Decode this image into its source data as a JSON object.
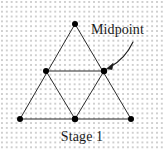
{
  "figure": {
    "caption": "Stage 1",
    "annotation_label": "Midpoint",
    "background": {
      "color": "#ffffff",
      "dot_color": "#cfcfcf",
      "dot_spacing_px": 4.85,
      "pattern": "dot-grid"
    },
    "style": {
      "line_color": "#2b2b2b",
      "line_width_px": 1,
      "vertex_color": "#000000",
      "vertex_radius_px": 3,
      "text_color": "#1a1a1a"
    },
    "outer_triangle": {
      "name": "outer-triangle",
      "points": [
        {
          "name": "apex",
          "x": 75,
          "y": 24
        },
        {
          "name": "bottom-left",
          "x": 20,
          "y": 119
        },
        {
          "name": "bottom-right",
          "x": 131,
          "y": 119
        }
      ]
    },
    "inner_triangle": {
      "name": "inner-inverted-triangle",
      "points": [
        {
          "name": "left-midpoint",
          "x": 46,
          "y": 71
        },
        {
          "name": "right-midpoint",
          "x": 104,
          "y": 71
        },
        {
          "name": "bottom-midpoint",
          "x": 75,
          "y": 119
        }
      ]
    },
    "vertices": [
      {
        "name": "apex",
        "x": 75,
        "y": 24
      },
      {
        "name": "left-midpoint",
        "x": 46,
        "y": 71
      },
      {
        "name": "right-midpoint",
        "x": 104,
        "y": 71
      },
      {
        "name": "bottom-left",
        "x": 20,
        "y": 119
      },
      {
        "name": "bottom-midpoint",
        "x": 75,
        "y": 119
      },
      {
        "name": "bottom-right",
        "x": 131,
        "y": 119
      }
    ],
    "arrow": {
      "name": "midpoint-callout-arrow",
      "start": {
        "x": 133,
        "y": 43
      },
      "control": {
        "x": 124,
        "y": 58
      },
      "end": {
        "x": 107,
        "y": 68
      },
      "target_vertex": "right-midpoint"
    }
  }
}
